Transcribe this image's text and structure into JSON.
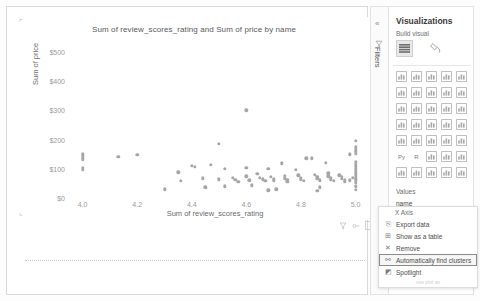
{
  "visual": {
    "title": "Sum of review_scores_rating and Sum of price by name",
    "y_axis_label": "Sum of price",
    "x_axis_label": "Sum of review_scores_rating",
    "corner_marker": "⌜",
    "corner_marker_bottom": "⌞",
    "footer_icons": [
      "filter-funnel-icon",
      "focus-mode-icon",
      "expand-icon"
    ]
  },
  "filters_rail": {
    "collapse_label": "«",
    "label": "Filters",
    "icon": "filter-icon"
  },
  "visualizations_pane": {
    "title": "Visualizations",
    "subtitle": "Build visual",
    "build_buttons": [
      "build-visual-fields-icon",
      "build-visual-format-icon"
    ],
    "values_header": "Values",
    "values_field": "name",
    "icon_names": [
      "stacked-bar-chart-icon",
      "stacked-column-chart-icon",
      "clustered-bar-chart-icon",
      "clustered-column-chart-icon",
      "hundred-percent-stacked-bar-icon",
      "line-chart-icon",
      "area-chart-icon",
      "stacked-area-chart-icon",
      "line-and-stacked-column-icon",
      "line-and-clustered-column-icon",
      "ribbon-chart-icon",
      "waterfall-chart-icon",
      "scatter-chart-icon",
      "pie-chart-icon",
      "donut-chart-icon",
      "treemap-icon",
      "map-icon",
      "filled-map-icon",
      "funnel-icon",
      "gauge-icon",
      "card-icon",
      "multi-row-card-icon",
      "kpi-icon",
      "table-icon",
      "matrix-icon",
      "python-visual-icon",
      "r-script-visual-icon",
      "key-influencers-icon",
      "narrative-icon",
      "paginated-report-icon",
      "decomposition-tree-icon",
      "smart-narrative-icon",
      "q-and-a-icon",
      "get-more-visuals-icon",
      "more-options-icon"
    ]
  },
  "context_menu": {
    "header": "X Axis",
    "items": [
      {
        "label": "Export data",
        "icon": "export-data-icon",
        "highlighted": false
      },
      {
        "label": "Show as a table",
        "icon": "show-as-table-icon",
        "highlighted": false
      },
      {
        "label": "Remove",
        "icon": "remove-icon",
        "highlighted": false
      },
      {
        "label": "Automatically find clusters",
        "icon": "find-clusters-icon",
        "highlighted": true
      },
      {
        "label": "Spotlight",
        "icon": "spotlight-icon",
        "highlighted": false
      }
    ],
    "ghost_label": "see plot as"
  },
  "chart_data": {
    "type": "scatter",
    "title": "Sum of review_scores_rating and Sum of price by name",
    "xlabel": "Sum of review_scores_rating",
    "ylabel": "Sum of price",
    "xlim": [
      3.95,
      5.02
    ],
    "ylim": [
      0,
      530
    ],
    "xticks": [
      "4.0",
      "4.2",
      "4.4",
      "4.6",
      "4.8",
      "5.0"
    ],
    "xtick_values": [
      4.0,
      4.2,
      4.4,
      4.6,
      4.8,
      5.0
    ],
    "yticks": [
      "$0",
      "$100",
      "$200",
      "$300",
      "$400",
      "$500"
    ],
    "ytick_values": [
      0,
      100,
      200,
      300,
      400,
      500
    ],
    "grid": false,
    "legend": "none",
    "marker_color": "#a6a6a6",
    "points": [
      [
        4.0,
        150
      ],
      [
        4.0,
        144
      ],
      [
        4.0,
        138
      ],
      [
        4.0,
        132
      ],
      [
        4.0,
        103
      ],
      [
        4.0,
        96
      ],
      [
        4.13,
        140
      ],
      [
        4.35,
        88
      ],
      [
        4.36,
        58
      ],
      [
        4.4,
        110
      ],
      [
        4.41,
        106
      ],
      [
        4.44,
        68
      ],
      [
        4.47,
        113
      ],
      [
        4.5,
        185
      ],
      [
        4.52,
        99
      ],
      [
        4.5,
        64
      ],
      [
        4.52,
        40
      ],
      [
        4.55,
        70
      ],
      [
        4.56,
        62
      ],
      [
        4.57,
        56
      ],
      [
        4.6,
        300
      ],
      [
        4.6,
        103
      ],
      [
        4.6,
        74
      ],
      [
        4.61,
        60
      ],
      [
        4.62,
        44
      ],
      [
        4.64,
        82
      ],
      [
        4.65,
        70
      ],
      [
        4.66,
        64
      ],
      [
        4.67,
        58
      ],
      [
        4.68,
        100
      ],
      [
        4.69,
        72
      ],
      [
        4.7,
        66
      ],
      [
        4.7,
        60
      ],
      [
        4.71,
        30
      ],
      [
        4.73,
        118
      ],
      [
        4.74,
        76
      ],
      [
        4.74,
        68
      ],
      [
        4.75,
        62
      ],
      [
        4.75,
        56
      ],
      [
        4.78,
        96
      ],
      [
        4.79,
        78
      ],
      [
        4.8,
        70
      ],
      [
        4.8,
        64
      ],
      [
        4.81,
        58
      ],
      [
        4.82,
        136
      ],
      [
        4.84,
        136
      ],
      [
        4.85,
        80
      ],
      [
        4.86,
        72
      ],
      [
        4.86,
        66
      ],
      [
        4.87,
        60
      ],
      [
        4.87,
        36
      ],
      [
        4.89,
        120
      ],
      [
        4.9,
        84
      ],
      [
        4.9,
        74
      ],
      [
        4.91,
        68
      ],
      [
        4.91,
        62
      ],
      [
        4.92,
        58
      ],
      [
        4.94,
        78
      ],
      [
        4.95,
        72
      ],
      [
        4.95,
        66
      ],
      [
        4.96,
        60
      ],
      [
        4.96,
        56
      ],
      [
        5.0,
        196
      ],
      [
        5.0,
        176
      ],
      [
        5.0,
        168
      ],
      [
        5.0,
        160
      ],
      [
        5.0,
        152
      ],
      [
        5.0,
        124
      ],
      [
        5.0,
        116
      ],
      [
        5.0,
        108
      ],
      [
        5.0,
        100
      ],
      [
        5.0,
        92
      ],
      [
        5.0,
        84
      ],
      [
        5.0,
        76
      ],
      [
        5.0,
        68
      ],
      [
        5.0,
        60
      ],
      [
        5.0,
        52
      ],
      [
        5.0,
        40
      ],
      [
        5.0,
        28
      ],
      [
        4.98,
        150
      ],
      [
        4.98,
        60
      ],
      [
        4.99,
        70
      ],
      [
        4.45,
        36
      ],
      [
        4.3,
        30
      ],
      [
        4.68,
        26
      ],
      [
        4.86,
        24
      ],
      [
        4.2,
        148
      ]
    ]
  }
}
